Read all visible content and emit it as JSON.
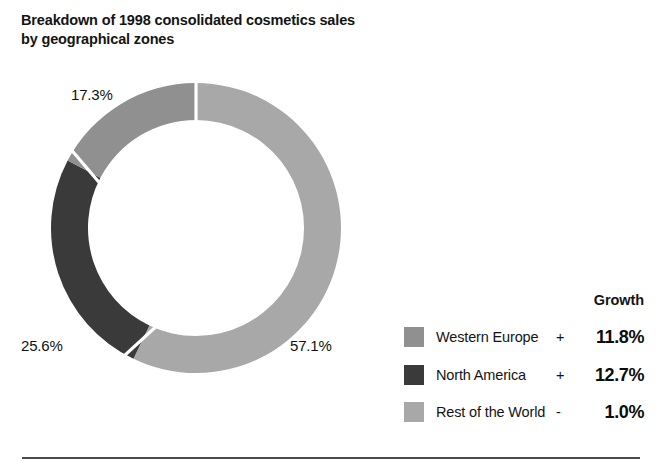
{
  "title": "Breakdown of 1998 consolidated cosmetics sales\nby geographical zones",
  "legend": {
    "growth_header": "Growth",
    "rows": [
      {
        "label": "Western Europe",
        "sign": "+",
        "value": "11.8%",
        "color": "#909090",
        "swatch_name": "legend-swatch-western-europe"
      },
      {
        "label": "North America",
        "sign": "+",
        "value": "12.7%",
        "color": "#3a3a3a",
        "swatch_name": "legend-swatch-north-america"
      },
      {
        "label": "Rest of the World",
        "sign": "-",
        "value": "1.0%",
        "color": "#a8a8a8",
        "swatch_name": "legend-swatch-rest-of-world"
      }
    ]
  },
  "slice_labels": {
    "western_europe": "17.3%",
    "north_america": "25.6%",
    "rest_of_world": "57.1%"
  },
  "colors": {
    "western_europe": "#909090",
    "north_america": "#3a3a3a",
    "rest_of_world": "#a8a8a8",
    "gap": "#ffffff",
    "rule": "#4b4b4b",
    "text": "#141414"
  },
  "chart_data": {
    "type": "pie",
    "variant": "donut",
    "title": "Breakdown of 1998 consolidated cosmetics sales by geographical zones",
    "subtitle": "",
    "xlabel": "",
    "ylabel": "",
    "unit": "percent",
    "total": 100.0,
    "legend_position": "right",
    "grid": false,
    "start_angle_deg": 0,
    "direction": "clockwise",
    "inner_radius_ratio": 0.745,
    "categories": [
      "Rest of the World",
      "North America",
      "Western Europe"
    ],
    "values": [
      57.1,
      25.6,
      17.3
    ],
    "labels": [
      "57.1%",
      "25.6%",
      "17.3%"
    ],
    "slice_colors": [
      "#a8a8a8",
      "#3a3a3a",
      "#909090"
    ],
    "slices": [
      {
        "name": "Rest of the World",
        "value": 57.1,
        "label": "57.1%",
        "color": "#a8a8a8",
        "growth_sign": "-",
        "growth": "1.0%",
        "growth_value": -1.0
      },
      {
        "name": "North America",
        "value": 25.6,
        "label": "25.6%",
        "color": "#3a3a3a",
        "growth_sign": "+",
        "growth": "12.7%",
        "growth_value": 12.7
      },
      {
        "name": "Western Europe",
        "value": 17.3,
        "label": "17.3%",
        "color": "#909090",
        "growth_sign": "+",
        "growth": "11.8%",
        "growth_value": 11.8
      }
    ],
    "series": [
      {
        "name": "1998 consolidated cosmetics sales share (%)",
        "values": [
          57.1,
          25.6,
          17.3
        ]
      },
      {
        "name": "Growth (%)",
        "values": [
          -1.0,
          12.7,
          11.8
        ]
      }
    ],
    "annotations": [
      "Growth"
    ]
  }
}
